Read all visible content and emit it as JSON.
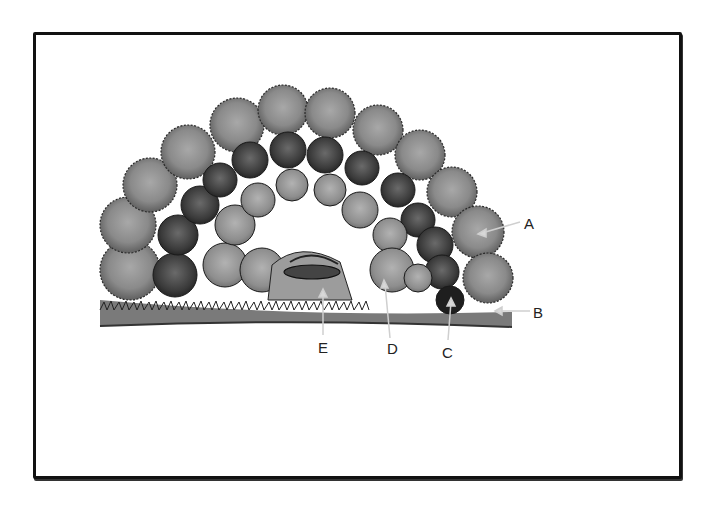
{
  "figure": {
    "type": "vegetation cross-section illustration",
    "style": "grayscale watercolor"
  },
  "labels": [
    {
      "id": "A",
      "text": "A",
      "x": 524,
      "y": 216
    },
    {
      "id": "B",
      "text": "B",
      "x": 533,
      "y": 305
    },
    {
      "id": "C",
      "text": "C",
      "x": 442,
      "y": 345
    },
    {
      "id": "D",
      "text": "D",
      "x": 387,
      "y": 341
    },
    {
      "id": "E",
      "text": "E",
      "x": 318,
      "y": 340
    }
  ],
  "colors": {
    "frame": "#111111",
    "canopy_outer": "#8a8a8a",
    "canopy_mid": "#5a5a5a",
    "canopy_dark": "#333333",
    "ground": "#9a9a9a",
    "arrow": "#d8d8d8"
  }
}
